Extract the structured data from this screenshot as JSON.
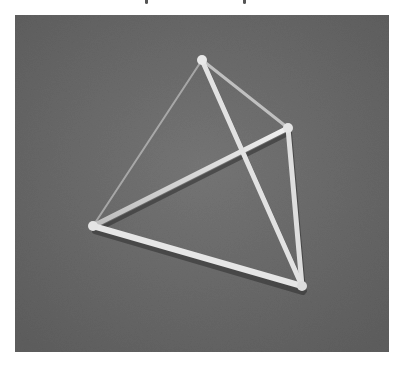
{
  "page": {
    "background": "#ffffff",
    "top_text_fragment": {
      "visible": true,
      "note": "cut-off caption text; only descenders visible",
      "descender_positions_x": [
        145,
        243
      ]
    }
  },
  "photo": {
    "subject": "stick-model tetrahedron",
    "background_color": "#6b6b6b",
    "stick_color": "#d8d8d8",
    "shadow_color": "#2e2e2e",
    "vertices": {
      "top": [
        187,
        45
      ],
      "right": [
        273,
        113
      ],
      "left": [
        78,
        211
      ],
      "bottom": [
        287,
        271
      ]
    },
    "edges": [
      {
        "name": "top-left",
        "from": "top",
        "to": "left",
        "width": 2,
        "opacity": 0.6
      },
      {
        "name": "top-right",
        "from": "top",
        "to": "right",
        "width": 3,
        "opacity": 0.8
      },
      {
        "name": "left-right",
        "from": "left",
        "to": "right",
        "width": 5,
        "opacity": 1
      },
      {
        "name": "left-bottom",
        "from": "left",
        "to": "bottom",
        "width": 6,
        "opacity": 1
      },
      {
        "name": "right-bottom",
        "from": "right",
        "to": "bottom",
        "width": 5,
        "opacity": 1
      },
      {
        "name": "top-bottom",
        "from": "top",
        "to": "bottom",
        "width": 5,
        "opacity": 1
      }
    ]
  }
}
